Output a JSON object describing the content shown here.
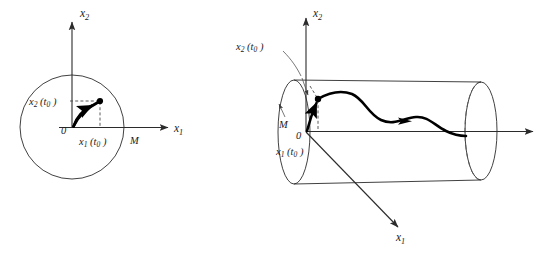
{
  "figure": {
    "background_color": "#ffffff",
    "ink_color": "#1a1a1a"
  },
  "panels": [
    {
      "id": "left-panel",
      "name": "phase-plane-disk",
      "description": "Two-dimensional phase plane with bounding circle of radius M",
      "axes": [
        {
          "name": "vertical-axis",
          "label": "x",
          "subscript": "2"
        },
        {
          "name": "horizontal-axis",
          "label": "x",
          "subscript": "1"
        }
      ],
      "labels": {
        "origin": "0",
        "radius": "M",
        "x2_at_t0": {
          "base": "x",
          "sub": "2",
          "arg": "(t",
          "arg_sub": "0",
          "arg_close": ")"
        },
        "x1_at_t0": {
          "base": "x",
          "sub": "1",
          "arg": "(t",
          "arg_sub": "0",
          "arg_close": ")"
        }
      },
      "geometry": {
        "circle_center": [
          72,
          127
        ],
        "circle_radius": 52,
        "state_point": [
          100,
          101
        ],
        "origin_point": [
          72,
          127
        ]
      }
    },
    {
      "id": "right-panel",
      "name": "trajectory-tube-cylinder",
      "description": "Three-dimensional tube (cylinder) of radius M along the time axis containing the trajectory",
      "axes": [
        {
          "name": "vertical-axis",
          "label": "x",
          "subscript": "2"
        },
        {
          "name": "depth-axis",
          "label": "x",
          "subscript": "1"
        },
        {
          "name": "time-axis",
          "label": "",
          "subscript": ""
        }
      ],
      "labels": {
        "origin": "0",
        "radius": "M",
        "x2_at_t0": {
          "base": "x",
          "sub": "2",
          "arg": "(t",
          "arg_sub": "0",
          "arg_close": ")"
        },
        "x1_at_t0": {
          "base": "x",
          "sub": "1",
          "arg": "(t",
          "arg_sub": "0",
          "arg_close": ")"
        }
      },
      "geometry": {
        "near_ellipse_center": [
          294,
          132
        ],
        "near_ellipse_rx": 16,
        "near_ellipse_ry": 52,
        "far_ellipse_center": [
          481,
          131
        ],
        "far_ellipse_rx": 16,
        "far_ellipse_ry": 49,
        "state_point": [
          318,
          99
        ]
      }
    }
  ],
  "annotations": {
    "left_radius_label": "M",
    "right_radius_label": "M",
    "origin_label": "0"
  }
}
